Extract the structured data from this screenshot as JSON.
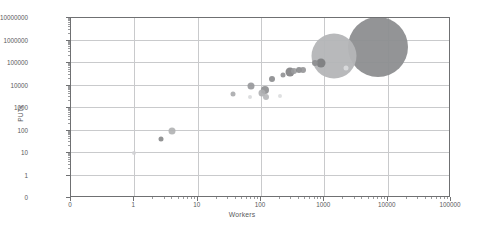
{
  "chart_data": {
    "type": "scatter",
    "title": "",
    "xlabel": "Workers",
    "ylabel": "PUTs",
    "xscale": "log",
    "yscale": "log",
    "xlim": [
      1,
      100000
    ],
    "ylim": [
      1,
      10000000
    ],
    "grid": true,
    "legend": "none",
    "xticks": [
      "0",
      "1",
      "10",
      "100",
      "1000",
      "10000",
      "100000"
    ],
    "yticks": [
      "0",
      "1",
      "10",
      "100",
      "1000",
      "10000",
      "100000",
      "1000000",
      "10000000"
    ],
    "points": [
      {
        "label": "p1",
        "x": 1,
        "y": 10,
        "size": 4,
        "color": "#d0d1d3",
        "opacity": 0.85
      },
      {
        "label": "p2",
        "x": 2.6,
        "y": 40,
        "size": 5,
        "color": "#87888a",
        "opacity": 0.9
      },
      {
        "label": "p3",
        "x": 3.9,
        "y": 100,
        "size": 7,
        "color": "#b0b1b3",
        "opacity": 0.9
      },
      {
        "label": "p4",
        "x": 36,
        "y": 4000,
        "size": 5,
        "color": "#a9aaac",
        "opacity": 0.9
      },
      {
        "label": "p5",
        "x": 66,
        "y": 3000,
        "size": 4,
        "color": "#d6d7d9",
        "opacity": 0.85
      },
      {
        "label": "p6",
        "x": 70,
        "y": 10000,
        "size": 7,
        "color": "#96979a",
        "opacity": 0.9
      },
      {
        "label": "p7",
        "x": 105,
        "y": 4500,
        "size": 7,
        "color": "#aeafb1",
        "opacity": 0.9
      },
      {
        "label": "p8",
        "x": 115,
        "y": 6500,
        "size": 8,
        "color": "#8d8e90",
        "opacity": 0.9
      },
      {
        "label": "p9",
        "x": 120,
        "y": 3000,
        "size": 6,
        "color": "#b6b7b9",
        "opacity": 0.9
      },
      {
        "label": "p10",
        "x": 150,
        "y": 20000,
        "size": 6,
        "color": "#8a8b8d",
        "opacity": 0.9
      },
      {
        "label": "p11",
        "x": 200,
        "y": 3500,
        "size": 4,
        "color": "#d9dadc",
        "opacity": 0.85
      },
      {
        "label": "p12",
        "x": 220,
        "y": 30000,
        "size": 5,
        "color": "#8f9092",
        "opacity": 0.9
      },
      {
        "label": "p13",
        "x": 290,
        "y": 40000,
        "size": 9,
        "color": "#7f8082",
        "opacity": 0.9
      },
      {
        "label": "p14",
        "x": 330,
        "y": 45000,
        "size": 6,
        "color": "#9a9b9d",
        "opacity": 0.9
      },
      {
        "label": "p15",
        "x": 400,
        "y": 48000,
        "size": 6,
        "color": "#8a8b8d",
        "opacity": 0.9
      },
      {
        "label": "p16",
        "x": 460,
        "y": 50000,
        "size": 6,
        "color": "#939496",
        "opacity": 0.9
      },
      {
        "label": "p17",
        "x": 700,
        "y": 100000,
        "size": 6,
        "color": "#8c8d8f",
        "opacity": 0.9
      },
      {
        "label": "p18",
        "x": 1400,
        "y": 200000,
        "size": 45,
        "color": "#b4b5b7",
        "opacity": 0.95
      },
      {
        "label": "p19",
        "x": 900,
        "y": 100000,
        "size": 9,
        "color": "#7b7c7e",
        "opacity": 0.9
      },
      {
        "label": "p20",
        "x": 2200,
        "y": 60000,
        "size": 5,
        "color": "#dddee0",
        "opacity": 0.85
      },
      {
        "label": "p21",
        "x": 7000,
        "y": 500000,
        "size": 60,
        "color": "#8d8e90",
        "opacity": 0.95
      }
    ]
  }
}
